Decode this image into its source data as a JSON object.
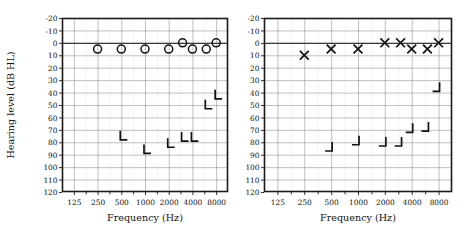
{
  "figure": {
    "title": "",
    "panels": 2
  },
  "axes": {
    "ylabel": "Hearing level (dB HL)",
    "xlabel": "Frequency (Hz)",
    "y_ticks": [
      "-20",
      "-10",
      "0",
      "10",
      "20",
      "30",
      "40",
      "50",
      "60",
      "70",
      "80",
      "90",
      "100",
      "110",
      "120"
    ],
    "x_ticks": [
      "125",
      "250",
      "500",
      "1000",
      "2000",
      "4000",
      "8000"
    ],
    "ylim": [
      -20,
      120
    ],
    "y_step": 10,
    "grid": true
  },
  "chart_data": [
    {
      "type": "scatter",
      "name": "right-ear-audiogram",
      "panel": "left",
      "title": "",
      "xlabel": "Frequency (Hz)",
      "ylabel": "Hearing level (dB HL)",
      "xscale": "log2",
      "xlim": [
        125,
        11314
      ],
      "ylim": [
        -20,
        120
      ],
      "y_inverted": true,
      "xticks": [
        125,
        250,
        500,
        1000,
        2000,
        4000,
        8000
      ],
      "xticklabels": [
        "125",
        "250",
        "500",
        "1000",
        "2000",
        "4000",
        "8000"
      ],
      "yticks": [
        -20,
        -10,
        0,
        10,
        20,
        30,
        40,
        50,
        60,
        70,
        80,
        90,
        100,
        110,
        120
      ],
      "grid": true,
      "legend": "none",
      "series": [
        {
          "name": "Air conduction (right, unmasked)",
          "marker": "circle",
          "x": [
            250,
            500,
            1000,
            2000,
            3000,
            4000,
            6000,
            8000
          ],
          "y": [
            5,
            5,
            5,
            5,
            0,
            5,
            5,
            0
          ]
        },
        {
          "name": "Bone conduction (right, masked)",
          "marker": "bracket-left",
          "x": [
            500,
            1000,
            2000,
            3000,
            4000,
            6000,
            8000
          ],
          "y": [
            78,
            89,
            84,
            79,
            79,
            53,
            45
          ]
        }
      ]
    },
    {
      "type": "scatter",
      "name": "left-ear-audiogram",
      "panel": "right",
      "title": "",
      "xlabel": "Frequency (Hz)",
      "ylabel": "Hearing level (dB HL)",
      "xscale": "log2",
      "xlim": [
        125,
        11314
      ],
      "ylim": [
        -20,
        120
      ],
      "y_inverted": true,
      "xticks": [
        125,
        250,
        500,
        1000,
        2000,
        4000,
        8000
      ],
      "xticklabels": [
        "125",
        "250",
        "500",
        "1000",
        "2000",
        "4000",
        "8000"
      ],
      "yticks": [
        -20,
        -10,
        0,
        10,
        20,
        30,
        40,
        50,
        60,
        70,
        80,
        90,
        100,
        110,
        120
      ],
      "grid": true,
      "legend": "none",
      "series": [
        {
          "name": "Air conduction (left, unmasked)",
          "marker": "cross",
          "x": [
            250,
            500,
            1000,
            2000,
            3000,
            4000,
            6000,
            8000
          ],
          "y": [
            10,
            5,
            5,
            0,
            0,
            5,
            5,
            0
          ]
        },
        {
          "name": "Bone conduction (left, masked)",
          "marker": "bracket-right",
          "x": [
            500,
            1000,
            2000,
            3000,
            4000,
            6000,
            8000
          ],
          "y": [
            87,
            82,
            83,
            83,
            72,
            71,
            39
          ]
        }
      ]
    }
  ]
}
